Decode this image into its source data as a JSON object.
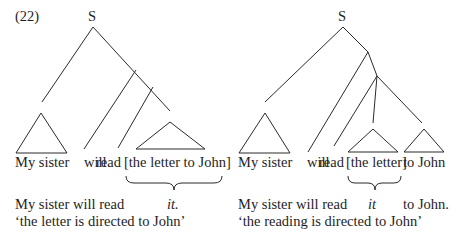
{
  "example_number": "(22)",
  "left_tree": {
    "root_label": "S",
    "surface_words": [
      "My sister",
      "will",
      "read",
      "[the letter to John]"
    ],
    "paraphrase_line1_prefix": "My sister will read",
    "paraphrase_pronoun": "it.",
    "gloss": "‘the letter is directed to John’"
  },
  "right_tree": {
    "root_label": "S",
    "surface_words": [
      "My sister",
      "will",
      "read",
      "[the letter]",
      "to John"
    ],
    "paraphrase_line1_prefix": "My sister will read",
    "paraphrase_pronoun": "it",
    "paraphrase_suffix": "to John.",
    "gloss": "‘the reading is directed to John’"
  },
  "colors": {
    "line": "#2a2a2a",
    "text": "#1e1e1e",
    "background": "#ffffff"
  }
}
